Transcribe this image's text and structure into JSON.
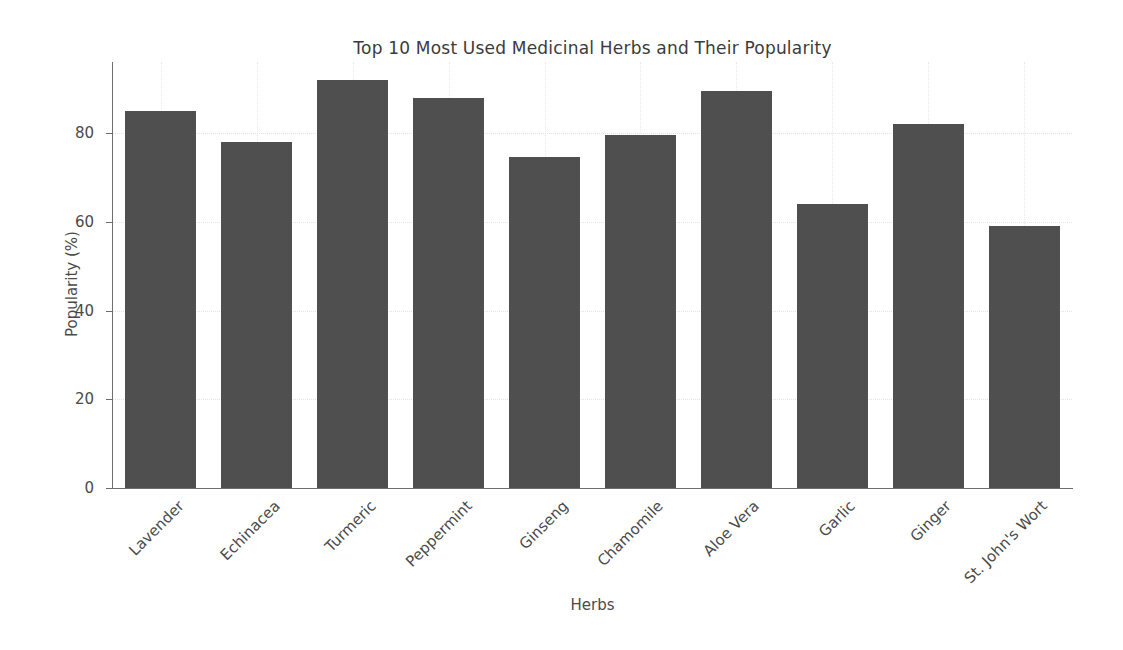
{
  "chart_data": {
    "type": "bar",
    "title": "Top 10 Most Used Medicinal Herbs and Their Popularity",
    "xlabel": "Herbs",
    "ylabel": "Popularity (%)",
    "categories": [
      "Lavender",
      "Echinacea",
      "Turmeric",
      "Peppermint",
      "Ginseng",
      "Chamomile",
      "Aloe Vera",
      "Garlic",
      "Ginger",
      "St. John's Wort"
    ],
    "values": [
      85,
      78,
      92,
      88,
      74.5,
      79.5,
      89.5,
      64,
      82,
      59
    ],
    "ylim": [
      0,
      96
    ],
    "xlim": [
      -0.5,
      9.5
    ],
    "yticks": [
      0,
      20,
      40,
      60,
      80
    ],
    "ytick_labels": [
      "0",
      "20",
      "40",
      "60",
      "80"
    ],
    "grid": true,
    "grid_axis": "both",
    "grid_style": "dotted",
    "legend": null,
    "bar_color": "#4f4f4f",
    "background_color": "#ffffff",
    "xtick_rotation": -45
  }
}
